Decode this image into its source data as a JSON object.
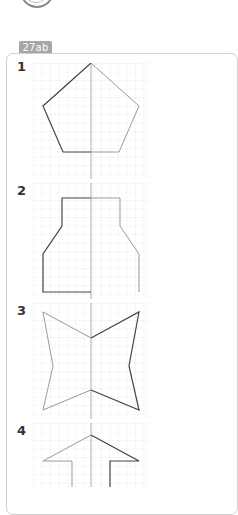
{
  "header": {
    "tab_label": "27ab"
  },
  "exercises": [
    {
      "number": "1",
      "shape": "pentagon"
    },
    {
      "number": "2",
      "shape": "bottle"
    },
    {
      "number": "3",
      "shape": "bow-tie-star"
    },
    {
      "number": "4",
      "shape": "arrow-house"
    }
  ],
  "colors": {
    "tab_bg": "#a6a6a6",
    "grid_line": "#c8c8c8",
    "axis_line": "#b0b0b0",
    "given_half": "#444444",
    "mirrored_half": "#9a9a9a",
    "panel_border": "#d0d0d0"
  }
}
